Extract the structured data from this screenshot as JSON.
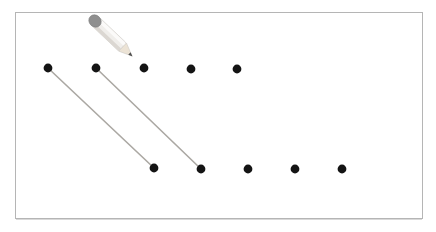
{
  "canvas": {
    "width": 436,
    "height": 232,
    "background": "#ffffff",
    "frame": {
      "x": 15,
      "y": 12,
      "width": 407,
      "height": 206,
      "fill": "#ffffff",
      "border_color": "#b5b5b5",
      "bottom_shadow_color": "#d9d9d9"
    }
  },
  "colors": {
    "dot": "#141414",
    "connection_line": "#aba8a3",
    "pencil": {
      "eraser": "#8f8f8f",
      "eraser_edge": "#7c7c7c",
      "body": "#f0eeeb",
      "body_light": "#fbfaf9",
      "body_shade": "#dbd7d2",
      "outline": "#cfccc7",
      "tip": "#ece3d5",
      "point": "#4f4f4f"
    }
  },
  "pencil_icon": {
    "anchor_x": 95,
    "anchor_y": 21,
    "rotation_deg": 43.4
  },
  "dots": {
    "radius_px": 4.4,
    "top_row": [
      {
        "x": 48,
        "y": 68
      },
      {
        "x": 96,
        "y": 68
      },
      {
        "x": 144,
        "y": 68
      },
      {
        "x": 191,
        "y": 69
      },
      {
        "x": 237,
        "y": 69
      }
    ],
    "bottom_row": [
      {
        "x": 154,
        "y": 168
      },
      {
        "x": 201,
        "y": 169
      },
      {
        "x": 248,
        "y": 169
      },
      {
        "x": 295,
        "y": 169
      },
      {
        "x": 342,
        "y": 169
      }
    ]
  },
  "connections": [
    {
      "from_top_index": 0,
      "to_bottom_index": 0,
      "x1": 48,
      "y1": 68,
      "x2": 154,
      "y2": 168
    },
    {
      "from_top_index": 1,
      "to_bottom_index": 1,
      "x1": 96,
      "y1": 68,
      "x2": 201,
      "y2": 169
    }
  ],
  "line_width_px": 1.6
}
